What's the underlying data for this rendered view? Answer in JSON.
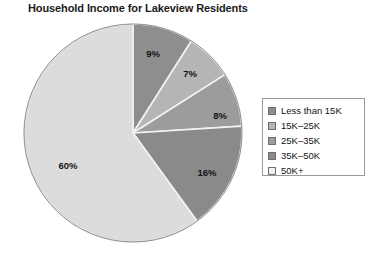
{
  "chart_data": {
    "type": "pie",
    "title": "Household Income for Lakeview Residents",
    "xlabel": "",
    "ylabel": "",
    "grid": false,
    "legend_position": "right",
    "start_angle_deg": 0,
    "direction": "clockwise",
    "categories": [
      "Less than 15K",
      "15K–25K",
      "25K–35K",
      "35K–50K",
      "50K+"
    ],
    "values": [
      9,
      7,
      8,
      16,
      60
    ],
    "value_unit": "percent",
    "data_labels": [
      "9%",
      "7%",
      "8%",
      "16%",
      "60%"
    ],
    "colors": [
      "#8e8e8e",
      "#b5b5b5",
      "#9c9c9c",
      "#8a8a8a",
      "#dcdcdc"
    ],
    "slice_edge_color": "#f2f2f2",
    "pie_outline_color": "#8d8d8d"
  },
  "legend": {
    "items": [
      {
        "label": "Less than 15K",
        "color": "#8e8e8e"
      },
      {
        "label": "15K–25K",
        "color": "#b5b5b5"
      },
      {
        "label": "25K–35K",
        "color": "#9c9c9c"
      },
      {
        "label": "35K–50K",
        "color": "#8a8a8a"
      },
      {
        "label": "50K+",
        "color": "#f0f0f0"
      }
    ]
  },
  "slice_labels": [
    {
      "text": "9%",
      "x": 130,
      "y": 30
    },
    {
      "text": "7%",
      "x": 167,
      "y": 50
    },
    {
      "text": "8%",
      "x": 197,
      "y": 92
    },
    {
      "text": "16%",
      "x": 184,
      "y": 149
    },
    {
      "text": "60%",
      "x": 45,
      "y": 142
    }
  ]
}
